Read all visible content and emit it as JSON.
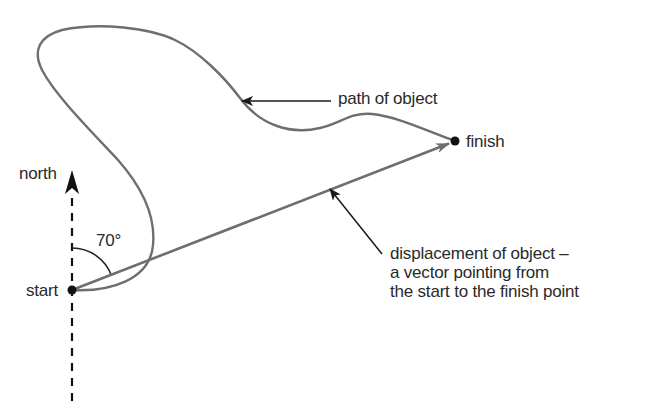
{
  "diagram": {
    "labels": {
      "north": "north",
      "start": "start",
      "finish": "finish",
      "angle": "70°",
      "path": "path of object",
      "displacement_lines": [
        "displacement of object –",
        "a vector pointing from",
        "the start to the finish point"
      ]
    },
    "points": {
      "start": {
        "x": 72,
        "y": 290
      },
      "finish": {
        "x": 455,
        "y": 141
      }
    },
    "angle_from_north_deg": 70,
    "colors": {
      "path": "#6e6e6e",
      "displacement": "#6e6e6e",
      "annotation": "#1a1a1a",
      "north_axis": "#111111",
      "text": "#2a2a2a"
    }
  }
}
